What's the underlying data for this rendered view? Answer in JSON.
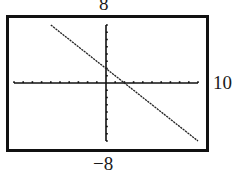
{
  "chart_data": {
    "type": "line",
    "title": "",
    "xlabel": "",
    "ylabel": "",
    "window": {
      "xmin": -10,
      "xmax": 10,
      "ymin": -8,
      "ymax": 8,
      "xscale": 1,
      "yscale": 1
    },
    "xlim": [
      -10,
      10
    ],
    "ylim": [
      -8,
      8
    ],
    "grid": false,
    "legend": null,
    "series": [
      {
        "name": "y = -x + 2",
        "equation": "y = -x + 2",
        "slope": -1,
        "y_intercept": 2,
        "x_intercept": 2,
        "x": [
          -6,
          10
        ],
        "y": [
          8,
          -8
        ]
      }
    ],
    "window_labels": {
      "ymax": "8",
      "xmax": "10",
      "ymin": "−8"
    }
  },
  "colors": {
    "axis": "#111111",
    "line": "#222222",
    "frame": "#111111"
  }
}
